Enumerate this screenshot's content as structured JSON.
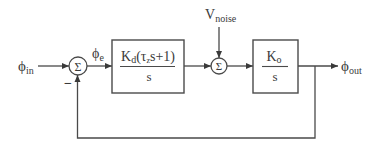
{
  "diagram": {
    "type": "control-loop-block-diagram",
    "signals": {
      "input": {
        "base": "ϕ",
        "sub": "in"
      },
      "error": {
        "base": "ϕ",
        "sub": "e"
      },
      "noise": {
        "base": "V",
        "sub": "noise"
      },
      "output": {
        "base": "ϕ",
        "sub": "out"
      }
    },
    "summing_junctions": [
      {
        "id": "sum1",
        "symbol": "Σ",
        "inputs": [
          "input (+)",
          "feedback (−)"
        ],
        "minus_label": "−"
      },
      {
        "id": "sum2",
        "symbol": "Σ",
        "inputs": [
          "block1 output",
          "noise"
        ]
      }
    ],
    "blocks": [
      {
        "id": "loop-filter",
        "numerator": {
          "k": "K",
          "k_sub": "d",
          "open": "(τ",
          "tau_sub": "z",
          "rest": "s+1)"
        },
        "denominator": "s"
      },
      {
        "id": "oscillator",
        "numerator": {
          "k": "K",
          "k_sub": "o"
        },
        "denominator": "s"
      }
    ],
    "feedback": "unity negative feedback from output to sum1"
  }
}
